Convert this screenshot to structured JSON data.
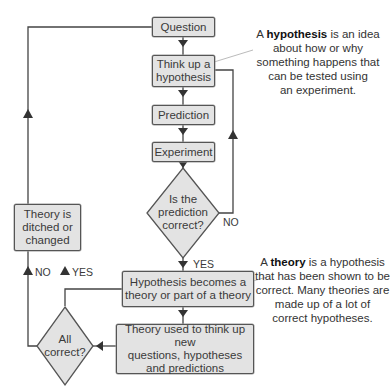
{
  "flowchart": {
    "nodes": {
      "question": "Question",
      "think_hypothesis": [
        "Think up a",
        "hypothesis"
      ],
      "prediction": "Prediction",
      "experiment": "Experiment",
      "decision_prediction": [
        "Is the",
        "prediction",
        "correct?"
      ],
      "hypothesis_theory": [
        "Hypothesis becomes a",
        "theory or part of a theory"
      ],
      "theory_used": [
        "Theory used to think up new",
        "questions, hypotheses",
        "and predictions"
      ],
      "decision_all": [
        "All",
        "correct?"
      ],
      "theory_ditched": [
        "Theory is",
        "ditched or",
        "changed"
      ]
    },
    "edge_labels": {
      "prediction_no": "NO",
      "prediction_yes": "YES",
      "all_no": "NO",
      "all_yes": "YES"
    }
  },
  "notes": {
    "hypothesis": {
      "prefix": "A ",
      "term": "hypothesis",
      "rest_line1": " is an idea",
      "lines": [
        "about how or why",
        "something happens that",
        "can be tested using",
        "an experiment."
      ]
    },
    "theory": {
      "prefix": "A ",
      "term": "theory",
      "rest_line1": " is a hypothesis",
      "lines": [
        "that has been shown to be",
        "correct. Many theories are",
        "made up of a lot of",
        "correct hypotheses."
      ]
    }
  },
  "colors": {
    "box_fill": "#e3e3e3",
    "line": "#444444"
  }
}
